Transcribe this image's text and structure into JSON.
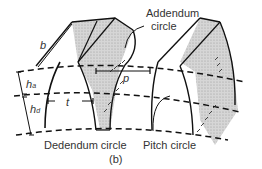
{
  "diagram": {
    "labels": {
      "addendum_line1": "Addendum",
      "addendum_line2": "circle",
      "dedendum": "Dedendum circle",
      "pitch": "Pitch circle",
      "face_width": "b",
      "circular_pitch": "p",
      "tooth_thickness": "t",
      "addendum_h": "h",
      "addendum_sub": "a",
      "dedendum_h": "h",
      "dedendum_sub": "d",
      "figure_tag": "(b)"
    },
    "colors": {
      "line": "#111111",
      "shade": "#cfcfcf",
      "text": "#333333"
    }
  }
}
